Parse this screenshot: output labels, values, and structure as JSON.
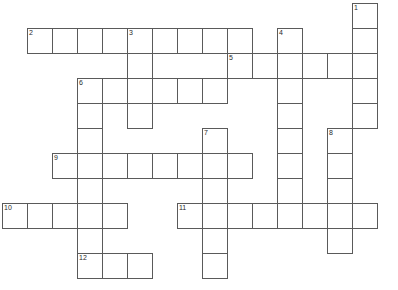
{
  "puzzle": {
    "title": "Crossword Puzzle Grid",
    "cell_size": 25,
    "origin_x": 2,
    "origin_y": 3,
    "columns": 16,
    "rows": 11,
    "grid_line_color": "#5a5a5a",
    "cell_fill_color": "#ffffff",
    "background_color": "#ffffff",
    "number_color": "#2a2a2a",
    "entries": [
      {
        "number": "1",
        "direction": "down",
        "row": 0,
        "col": 14,
        "length": 5
      },
      {
        "number": "2",
        "direction": "across",
        "row": 1,
        "col": 1,
        "length": 9
      },
      {
        "number": "3",
        "direction": "down",
        "row": 1,
        "col": 5,
        "length": 4
      },
      {
        "number": "4",
        "direction": "down",
        "row": 1,
        "col": 11,
        "length": 6
      },
      {
        "number": "5",
        "direction": "across",
        "row": 2,
        "col": 9,
        "length": 6
      },
      {
        "number": "6",
        "direction": "across",
        "row": 3,
        "col": 3,
        "length": 6
      },
      {
        "number": "6b",
        "direction": "down",
        "row": 3,
        "col": 3,
        "length": 8
      },
      {
        "number": "7",
        "direction": "down",
        "row": 5,
        "col": 8,
        "length": 6
      },
      {
        "number": "8",
        "direction": "down",
        "row": 5,
        "col": 13,
        "length": 6
      },
      {
        "number": "9",
        "direction": "across",
        "row": 6,
        "col": 2,
        "length": 8
      },
      {
        "number": "10",
        "direction": "across",
        "row": 8,
        "col": 0,
        "length": 5
      },
      {
        "number": "11",
        "direction": "across",
        "row": 8,
        "col": 7,
        "length": 8
      },
      {
        "number": "12",
        "direction": "across",
        "row": 10,
        "col": 3,
        "length": 3
      }
    ],
    "cells": [
      {
        "r": 0,
        "c": 14,
        "n": "1"
      },
      {
        "r": 1,
        "c": 1,
        "n": "2"
      },
      {
        "r": 1,
        "c": 2,
        "n": ""
      },
      {
        "r": 1,
        "c": 3,
        "n": ""
      },
      {
        "r": 1,
        "c": 4,
        "n": ""
      },
      {
        "r": 1,
        "c": 5,
        "n": "3"
      },
      {
        "r": 1,
        "c": 6,
        "n": ""
      },
      {
        "r": 1,
        "c": 7,
        "n": ""
      },
      {
        "r": 1,
        "c": 8,
        "n": ""
      },
      {
        "r": 1,
        "c": 9,
        "n": ""
      },
      {
        "r": 1,
        "c": 11,
        "n": "4"
      },
      {
        "r": 1,
        "c": 14,
        "n": ""
      },
      {
        "r": 2,
        "c": 5,
        "n": ""
      },
      {
        "r": 2,
        "c": 9,
        "n": "5"
      },
      {
        "r": 2,
        "c": 10,
        "n": ""
      },
      {
        "r": 2,
        "c": 11,
        "n": ""
      },
      {
        "r": 2,
        "c": 12,
        "n": ""
      },
      {
        "r": 2,
        "c": 13,
        "n": ""
      },
      {
        "r": 2,
        "c": 14,
        "n": ""
      },
      {
        "r": 3,
        "c": 3,
        "n": "6"
      },
      {
        "r": 3,
        "c": 4,
        "n": ""
      },
      {
        "r": 3,
        "c": 5,
        "n": ""
      },
      {
        "r": 3,
        "c": 6,
        "n": ""
      },
      {
        "r": 3,
        "c": 7,
        "n": ""
      },
      {
        "r": 3,
        "c": 8,
        "n": ""
      },
      {
        "r": 3,
        "c": 11,
        "n": ""
      },
      {
        "r": 3,
        "c": 14,
        "n": ""
      },
      {
        "r": 4,
        "c": 3,
        "n": ""
      },
      {
        "r": 4,
        "c": 5,
        "n": ""
      },
      {
        "r": 4,
        "c": 11,
        "n": ""
      },
      {
        "r": 4,
        "c": 14,
        "n": ""
      },
      {
        "r": 5,
        "c": 3,
        "n": ""
      },
      {
        "r": 5,
        "c": 8,
        "n": "7"
      },
      {
        "r": 5,
        "c": 11,
        "n": ""
      },
      {
        "r": 5,
        "c": 13,
        "n": "8"
      },
      {
        "r": 6,
        "c": 2,
        "n": "9"
      },
      {
        "r": 6,
        "c": 3,
        "n": ""
      },
      {
        "r": 6,
        "c": 4,
        "n": ""
      },
      {
        "r": 6,
        "c": 5,
        "n": ""
      },
      {
        "r": 6,
        "c": 6,
        "n": ""
      },
      {
        "r": 6,
        "c": 7,
        "n": ""
      },
      {
        "r": 6,
        "c": 8,
        "n": ""
      },
      {
        "r": 6,
        "c": 9,
        "n": ""
      },
      {
        "r": 6,
        "c": 11,
        "n": ""
      },
      {
        "r": 6,
        "c": 13,
        "n": ""
      },
      {
        "r": 7,
        "c": 3,
        "n": ""
      },
      {
        "r": 7,
        "c": 8,
        "n": ""
      },
      {
        "r": 7,
        "c": 11,
        "n": ""
      },
      {
        "r": 7,
        "c": 13,
        "n": ""
      },
      {
        "r": 8,
        "c": 0,
        "n": "10"
      },
      {
        "r": 8,
        "c": 1,
        "n": ""
      },
      {
        "r": 8,
        "c": 2,
        "n": ""
      },
      {
        "r": 8,
        "c": 3,
        "n": ""
      },
      {
        "r": 8,
        "c": 4,
        "n": ""
      },
      {
        "r": 8,
        "c": 7,
        "n": "11"
      },
      {
        "r": 8,
        "c": 8,
        "n": ""
      },
      {
        "r": 8,
        "c": 9,
        "n": ""
      },
      {
        "r": 8,
        "c": 10,
        "n": ""
      },
      {
        "r": 8,
        "c": 11,
        "n": ""
      },
      {
        "r": 8,
        "c": 12,
        "n": ""
      },
      {
        "r": 8,
        "c": 13,
        "n": ""
      },
      {
        "r": 8,
        "c": 14,
        "n": ""
      },
      {
        "r": 9,
        "c": 3,
        "n": ""
      },
      {
        "r": 9,
        "c": 8,
        "n": ""
      },
      {
        "r": 9,
        "c": 13,
        "n": ""
      },
      {
        "r": 10,
        "c": 3,
        "n": "12"
      },
      {
        "r": 10,
        "c": 4,
        "n": ""
      },
      {
        "r": 10,
        "c": 5,
        "n": ""
      },
      {
        "r": 10,
        "c": 8,
        "n": ""
      }
    ]
  }
}
